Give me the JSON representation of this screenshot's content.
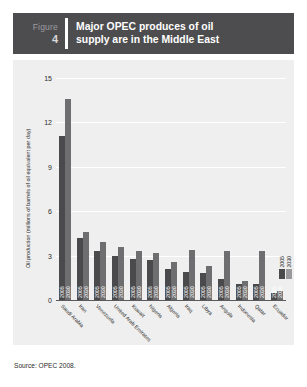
{
  "figure": {
    "label": "Figure",
    "number": "4",
    "title_line1": "Major OPEC produces of oil",
    "title_line2": "supply are in the Middle East"
  },
  "source": "Source: OPEC 2008.",
  "colors": {
    "header_bg": "#4d4d4f",
    "panel_bg": "#efefef",
    "bar_2005": "#4a4a4c",
    "bar_2030": "#6e6e70",
    "grid": "#ffffff",
    "text": "#2b2b2b"
  },
  "chart_data": {
    "type": "bar",
    "title": "Major OPEC produces of oil supply are in the Middle East",
    "xlabel": "",
    "ylabel": "Oil production (millions of barrels of oil equivalent per day)",
    "ylim": [
      0,
      15
    ],
    "yticks": [
      0,
      3,
      6,
      9,
      12,
      15
    ],
    "grid": true,
    "legend_position": "right",
    "bar_year_captions": [
      "2005",
      "2030"
    ],
    "categories": [
      "Saudi Arabia",
      "Iran",
      "Venezuela",
      "United Arab Emirates",
      "Kuwait",
      "Nigeria",
      "Algeria",
      "Iraq",
      "Libya",
      "Angola",
      "Indonesia",
      "Qatar",
      "Ecuador"
    ],
    "series": [
      {
        "name": "2005",
        "values": [
          11.1,
          4.2,
          3.3,
          3.0,
          2.8,
          2.7,
          2.1,
          1.9,
          1.8,
          1.4,
          1.1,
          1.1,
          0.5
        ]
      },
      {
        "name": "2030",
        "values": [
          13.6,
          4.6,
          3.9,
          3.6,
          3.3,
          3.2,
          2.6,
          3.4,
          2.3,
          3.3,
          1.3,
          3.3,
          0.6
        ]
      }
    ]
  }
}
